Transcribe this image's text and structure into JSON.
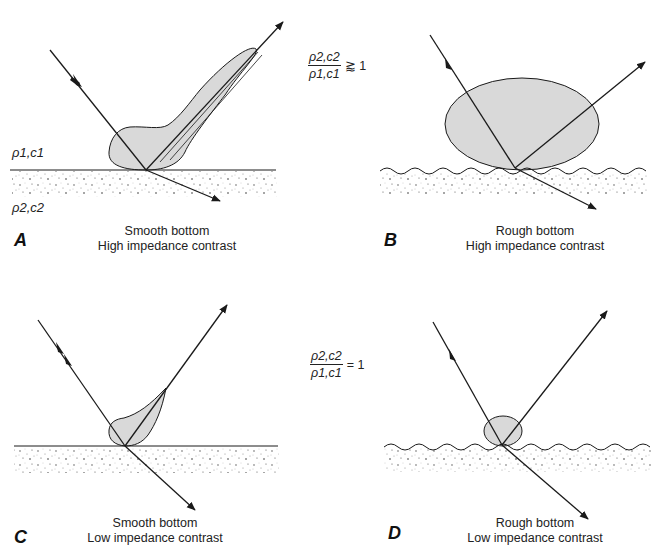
{
  "figure": {
    "panels": [
      {
        "letter": "A",
        "caption_line1": "Smooth bottom",
        "caption_line2": "High impedance contrast",
        "bottom": "smooth",
        "impedance_contrast": "high"
      },
      {
        "letter": "B",
        "caption_line1": "Rough bottom",
        "caption_line2": "High impedance contrast",
        "bottom": "rough",
        "impedance_contrast": "high"
      },
      {
        "letter": "C",
        "caption_line1": "Smooth bottom",
        "caption_line2": "Low impedance contrast",
        "bottom": "smooth",
        "impedance_contrast": "low"
      },
      {
        "letter": "D",
        "caption_line1": "Rough bottom",
        "caption_line2": "Low impedance contrast",
        "bottom": "rough",
        "impedance_contrast": "low"
      }
    ],
    "media": {
      "upper": "ρ1,c1",
      "lower": "ρ2,c2"
    },
    "ratios": [
      {
        "numerator": "ρ2,c2",
        "denominator": "ρ1,c1",
        "relation": "⪆ 1"
      },
      {
        "numerator": "ρ2,c2",
        "denominator": "ρ1,c1",
        "relation": "= 1"
      }
    ]
  },
  "colors": {
    "line": "#1a1a1a",
    "lobe_fill": "#d9d9d9",
    "sediment_dots": "#555555",
    "background": "#ffffff"
  }
}
